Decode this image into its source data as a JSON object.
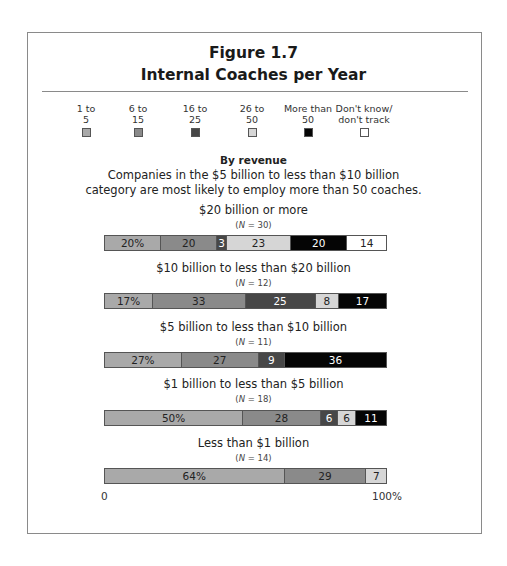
{
  "figure": {
    "number": "Figure 1.7",
    "title": "Internal Coaches per Year"
  },
  "legend": [
    {
      "line1": "1 to",
      "line2": "5",
      "color": "#a9a9a9",
      "text_color": "#222"
    },
    {
      "line1": "6 to",
      "line2": "15",
      "color": "#8a8a8a",
      "text_color": "#222"
    },
    {
      "line1": "16 to",
      "line2": "25",
      "color": "#474747",
      "text_color": "#ffffff"
    },
    {
      "line1": "26 to",
      "line2": "50",
      "color": "#d6d6d6",
      "text_color": "#222"
    },
    {
      "line1": "More than",
      "line2": "50",
      "color": "#050505",
      "text_color": "#ffffff"
    },
    {
      "line1": "Don't know/",
      "line2": "don't track",
      "color": "#ffffff",
      "text_color": "#222"
    }
  ],
  "section": {
    "heading": "By revenue",
    "note_line1": "Companies in the $5 billion to less than $10 billion",
    "note_line2": "category are most likely to employ more than 50 coaches."
  },
  "axis": {
    "min_label": "0",
    "max_label": "100%"
  },
  "groups": [
    {
      "label": "$20 billion or more",
      "n_prefix": "N",
      "n_value": " = 30)",
      "segments": [
        {
          "cat": 0,
          "value": 20,
          "text": "20%"
        },
        {
          "cat": 1,
          "value": 20,
          "text": "20"
        },
        {
          "cat": 2,
          "value": 3,
          "text": "3"
        },
        {
          "cat": 3,
          "value": 23,
          "text": "23"
        },
        {
          "cat": 4,
          "value": 20,
          "text": "20"
        },
        {
          "cat": 5,
          "value": 14,
          "text": "14"
        }
      ]
    },
    {
      "label": "$10 billion to less than $20 billion",
      "n_prefix": "N",
      "n_value": " = 12)",
      "segments": [
        {
          "cat": 0,
          "value": 17,
          "text": "17%"
        },
        {
          "cat": 1,
          "value": 33,
          "text": "33"
        },
        {
          "cat": 2,
          "value": 25,
          "text": "25"
        },
        {
          "cat": 3,
          "value": 8,
          "text": "8"
        },
        {
          "cat": 4,
          "value": 17,
          "text": "17"
        }
      ]
    },
    {
      "label": "$5 billion to less than $10 billion",
      "n_prefix": "N",
      "n_value": " = 11)",
      "segments": [
        {
          "cat": 0,
          "value": 27,
          "text": "27%"
        },
        {
          "cat": 1,
          "value": 27,
          "text": "27"
        },
        {
          "cat": 2,
          "value": 9,
          "text": "9"
        },
        {
          "cat": 4,
          "value": 36,
          "text": "36"
        }
      ]
    },
    {
      "label": "$1 billion to less than $5 billion",
      "n_prefix": "N",
      "n_value": " = 18)",
      "segments": [
        {
          "cat": 0,
          "value": 50,
          "text": "50%"
        },
        {
          "cat": 1,
          "value": 28,
          "text": "28"
        },
        {
          "cat": 2,
          "value": 6,
          "text": "6"
        },
        {
          "cat": 3,
          "value": 6,
          "text": "6"
        },
        {
          "cat": 4,
          "value": 11,
          "text": "11"
        }
      ]
    },
    {
      "label": "Less than $1 billion",
      "n_prefix": "N",
      "n_value": " = 14)",
      "segments": [
        {
          "cat": 0,
          "value": 64,
          "text": "64%"
        },
        {
          "cat": 1,
          "value": 29,
          "text": "29"
        },
        {
          "cat": 3,
          "value": 7,
          "text": "7"
        }
      ]
    }
  ],
  "chart_data": {
    "type": "bar",
    "orientation": "horizontal",
    "stacked": true,
    "subtitle": "By revenue",
    "annotation": "Companies in the $5 billion to less than $10 billion category are most likely to employ more than 50 coaches.",
    "xlabel": "",
    "ylabel": "",
    "xlim": [
      0,
      100
    ],
    "x_tick_labels": [
      "0",
      "100%"
    ],
    "legend_position": "top",
    "categories": [
      "$20 billion or more (N = 30)",
      "$10 billion to less than $20 billion (N = 12)",
      "$5 billion to less than $10 billion (N = 11)",
      "$1 billion to less than $5 billion (N = 18)",
      "Less than $1 billion (N = 14)"
    ],
    "series": [
      {
        "name": "1 to 5",
        "values": [
          20,
          17,
          27,
          50,
          64
        ]
      },
      {
        "name": "6 to 15",
        "values": [
          20,
          33,
          27,
          28,
          29
        ]
      },
      {
        "name": "16 to 25",
        "values": [
          3,
          25,
          9,
          6,
          0
        ]
      },
      {
        "name": "26 to 50",
        "values": [
          23,
          8,
          0,
          6,
          7
        ]
      },
      {
        "name": "More than 50",
        "values": [
          20,
          17,
          36,
          11,
          0
        ]
      },
      {
        "name": "Don't know/don't track",
        "values": [
          14,
          0,
          0,
          0,
          0
        ]
      }
    ]
  }
}
